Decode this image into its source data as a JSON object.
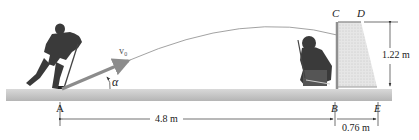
{
  "figure": {
    "points": {
      "A": "A",
      "B": "B",
      "C": "C",
      "D": "D",
      "E": "E"
    },
    "vector_label": "v₀",
    "angle_label": "α",
    "dimensions": {
      "horizontal_AB": "4.8 m",
      "horizontal_BE": "0.76 m",
      "net_height": "1.22 m"
    },
    "colors": {
      "ice_top": "#d4d4d4",
      "ice_bottom": "#b9b9b9",
      "velocity_arrow": "#8c8c8c",
      "net_fill": "#e0e0e0",
      "net_frame": "#9a9a9a",
      "trajectory": "#777777",
      "player": "#3a3a3a"
    }
  }
}
